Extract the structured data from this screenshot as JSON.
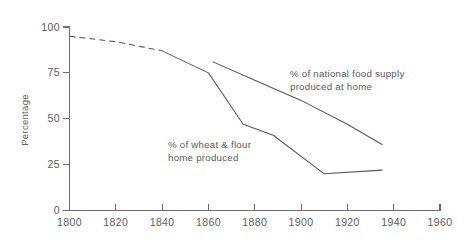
{
  "chart_data": {
    "type": "line",
    "title": "",
    "xlabel": "",
    "ylabel": "Percentage",
    "xlim": [
      1800,
      1960
    ],
    "ylim": [
      0,
      100
    ],
    "grid": false,
    "legend_position": "inline-annotations",
    "x_ticks": [
      "1800",
      "1820",
      "1840",
      "1860",
      "1880",
      "1900",
      "1920",
      "1940",
      "1960"
    ],
    "x_tick_values": [
      1800,
      1820,
      1840,
      1860,
      1880,
      1900,
      1920,
      1940,
      1960
    ],
    "y_ticks": [
      "0",
      "25",
      "50",
      "75",
      "100"
    ],
    "y_tick_values": [
      0,
      25,
      50,
      75,
      100
    ],
    "series": [
      {
        "name": "% of national food supply produced at home",
        "style": "solid",
        "x": [
          1862,
          1880,
          1900,
          1920,
          1935
        ],
        "values": [
          81,
          71,
          60,
          47,
          36
        ]
      },
      {
        "name": "% of wheat & flour home produced (estimated, dashed)",
        "style": "dashed",
        "x": [
          1800,
          1820,
          1840
        ],
        "values": [
          95,
          92,
          87
        ]
      },
      {
        "name": "% of wheat & flour home produced",
        "style": "solid",
        "x": [
          1840,
          1860,
          1875,
          1888,
          1910,
          1935
        ],
        "values": [
          87,
          75,
          47,
          41,
          20,
          22
        ]
      }
    ],
    "annotations": [
      {
        "id": "national-food-supply",
        "lines": [
          "% of national food supply",
          "produced at home"
        ],
        "x_px": 290,
        "y_px": 77
      },
      {
        "id": "wheat-flour",
        "lines": [
          "% of wheat & flour",
          "home produced"
        ],
        "x_px": 168,
        "y_px": 148
      }
    ],
    "colors": {
      "line": "#55565a",
      "axis": "#6e6e70",
      "text": "#5d5d60",
      "background": "#ffffff"
    }
  }
}
